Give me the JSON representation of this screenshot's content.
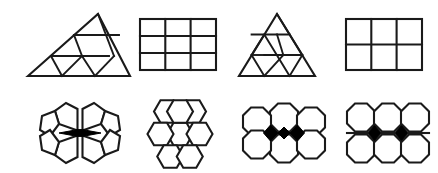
{
  "sheet": {
    "title": "Geometric tiling figures",
    "background_color": "#ffffff",
    "stroke_color": "#1a1a1a",
    "fill_color": "#ffffff",
    "accent_fill_color": "#000000",
    "row_count": 2,
    "column_count": 4,
    "figure_count": 8
  },
  "figures": [
    {
      "id": "figure-1",
      "row": 1,
      "column": 1,
      "name": "subdivided-flat-triangle",
      "label": "Flat triangle subdivided into 9 triangles",
      "shape": "triangle",
      "subdivision_rows": 3,
      "part_count": 9,
      "dark_parts": 0
    },
    {
      "id": "figure-2",
      "row": 1,
      "column": 2,
      "name": "rectangle-grid-3x3",
      "label": "Rectangle grid, 3 columns by 3 rows",
      "shape": "rectangle-grid",
      "grid_columns": 3,
      "grid_rows": 3,
      "part_count": 9,
      "dark_parts": 0
    },
    {
      "id": "figure-3",
      "row": 1,
      "column": 3,
      "name": "subdivided-equilateral-triangle",
      "label": "Equilateral triangle subdivided into 9 triangles",
      "shape": "triangle",
      "subdivision_rows": 3,
      "part_count": 9,
      "dark_parts": 0
    },
    {
      "id": "figure-4",
      "row": 1,
      "column": 4,
      "name": "rectangle-grid-3x2",
      "label": "Rectangle grid, 3 columns by 2 rows",
      "shape": "rectangle-grid",
      "grid_columns": 3,
      "grid_rows": 2,
      "part_count": 6,
      "dark_parts": 0
    },
    {
      "id": "figure-5",
      "row": 2,
      "column": 1,
      "name": "pentagon-rosette",
      "label": "Rosette of 6 pentagons around a dark lens",
      "shape": "pentagon-rosette",
      "part_count": 6,
      "dark_parts": 1
    },
    {
      "id": "figure-6",
      "row": 2,
      "column": 2,
      "name": "hexagon-flower",
      "label": "Honeycomb flower of 7 hexagons",
      "shape": "hexagon-flower",
      "part_count": 7,
      "dark_parts": 0
    },
    {
      "id": "figure-7",
      "row": 2,
      "column": 3,
      "name": "octagon-cluster-dark-band",
      "label": "Six octagons with dark band of gaps",
      "shape": "octagon-cluster",
      "grid_columns": 3,
      "grid_rows": 2,
      "part_count": 6,
      "dark_parts": 3
    },
    {
      "id": "figure-8",
      "row": 2,
      "column": 4,
      "name": "octagon-grid-dark-diamonds",
      "label": "Six octagons with two dark diamond gaps",
      "shape": "octagon-grid",
      "grid_columns": 3,
      "grid_rows": 2,
      "part_count": 6,
      "dark_parts": 2
    }
  ]
}
